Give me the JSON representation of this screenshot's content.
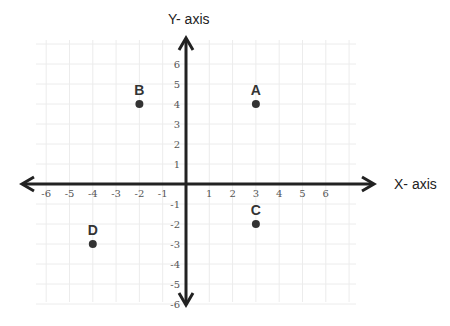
{
  "chart_data": {
    "type": "scatter",
    "title": "",
    "xlabel": "X- axis",
    "ylabel": "Y- axis",
    "xlim": [
      -6,
      6
    ],
    "ylim": [
      -6,
      6
    ],
    "grid": true,
    "x_ticks": [
      "-6",
      "-5",
      "-4",
      "-3",
      "-2",
      "-1",
      "1",
      "2",
      "3",
      "4",
      "5",
      "6"
    ],
    "y_ticks": [
      "6",
      "5",
      "4",
      "3",
      "2",
      "1",
      "-1",
      "-2",
      "-3",
      "-4",
      "-5",
      "-6"
    ],
    "points": [
      {
        "label": "A",
        "x": 3,
        "y": 4
      },
      {
        "label": "B",
        "x": -2,
        "y": 4
      },
      {
        "label": "C",
        "x": 3,
        "y": -2
      },
      {
        "label": "D",
        "x": -4,
        "y": -3
      }
    ]
  },
  "colors": {
    "axis": "#222222",
    "grid": "#ececec",
    "point": "#333333",
    "tick_text": "#555555"
  }
}
